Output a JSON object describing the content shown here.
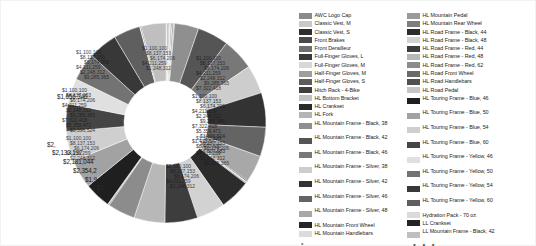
{
  "chart_data": {
    "type": "pie",
    "variant": "donut",
    "title": "",
    "subtitle": "",
    "xlabel": "",
    "ylabel": "",
    "grid": false,
    "legend_position": "right",
    "legend_columns": 2,
    "legend_truncated": true,
    "legend_truncation_glyph": "• • •",
    "value_prefix": "$",
    "value_format": "currency-thousands-separator",
    "donut_hole_ratio": 0.42,
    "palette_type": "grayscale",
    "visible_value_labels": [
      "$1,656,346",
      "$2,133,197",
      "$2,181,044",
      "$2,354,2",
      "$1,9",
      "$2,",
      "$1,"
    ],
    "categories": [
      "AWC Logo Cap",
      "Classic Vest, M",
      "Classic Vest, S",
      "Front Brakes",
      "Front Derailleur",
      "Full-Finger Gloves, L",
      "Full-Finger Gloves, M",
      "Half-Finger Gloves, M",
      "Half-Finger Gloves, S",
      "Hitch Rack - 4-Bike",
      "HL Bottom Bracket",
      "HL Crankset",
      "HL Fork",
      "HL Mountain Frame - Black, 38",
      "HL Mountain Frame - Black, 42",
      "HL Mountain Frame - Black, 46",
      "HL Mountain Frame - Silver, 38",
      "HL Mountain Frame - Silver, 42",
      "HL Mountain Frame - Silver, 46",
      "HL Mountain Frame - Silver, 48",
      "HL Mountain Front Wheel",
      "HL Mountain Handlebars",
      "HL Mountain Pedal",
      "HL Mountain Rear Wheel",
      "HL Road Frame - Black, 44",
      "HL Road Frame - Black, 48",
      "HL Road Frame - Red, 44",
      "HL Road Frame - Red, 48",
      "HL Road Frame - Red, 62",
      "HL Road Front Wheel",
      "HL Road Handlebars",
      "HL Road Pedal",
      "HL Touring Frame - Blue, 46",
      "HL Touring Frame - Blue, 50",
      "HL Touring Frame - Blue, 54",
      "HL Touring Frame - Blue, 60",
      "HL Touring Frame - Yellow, 46",
      "HL Touring Frame - Yellow, 50",
      "HL Touring Frame - Yellow, 54",
      "HL Touring Frame - Yellow, 60",
      "Hydration Pack - 70 oz.",
      "LL Crankset",
      "LL Mountain Frame - Black, 42"
    ],
    "values": [
      51229,
      38573,
      26928,
      64432,
      44213,
      34756,
      29881,
      31204,
      25117,
      57622,
      43109,
      61840,
      72355,
      1656346,
      2133197,
      2181044,
      1954223,
      2354233,
      2006118,
      1872540,
      66124,
      39871,
      28306,
      70452,
      2088912,
      1945330,
      2241507,
      2113994,
      1877260,
      59118,
      41260,
      27433,
      1799640,
      1962318,
      2044875,
      1881092,
      1748210,
      1903466,
      1988031,
      1822774,
      48902,
      55317,
      1693418
    ]
  },
  "legend": {
    "column_1": [
      {
        "label": "AWC Logo Cap",
        "color": "#8a8a8a"
      },
      {
        "label": "Classic Vest, M",
        "color": "#c9c9c9"
      },
      {
        "label": "Classic Vest, S",
        "color": "#2e2e2e"
      },
      {
        "label": "Front Brakes",
        "color": "#4a4a4a"
      },
      {
        "label": "Front Derailleur",
        "color": "#6f6f6f"
      },
      {
        "label": "Full-Finger Gloves, L",
        "color": "#3a3a3a"
      },
      {
        "label": "Full-Finger Gloves, M",
        "color": "#d8d8d8"
      },
      {
        "label": "Half-Finger Gloves, M",
        "color": "#9e9e9e"
      },
      {
        "label": "Half-Finger Gloves, S",
        "color": "#5c5c5c"
      },
      {
        "label": "Hitch Rack - 4-Bike",
        "color": "#3f3f3f"
      },
      {
        "label": "HL Bottom Bracket",
        "color": "#c2c2c2"
      },
      {
        "label": "HL Crankset",
        "color": "#2a2a2a"
      },
      {
        "label": "HL Fork",
        "color": "#b4b4b4"
      },
      {
        "label": "HL Mountain Frame - Black, 38",
        "color": "#8f8f8f"
      },
      {
        "label": "HL Mountain Frame - Black, 42",
        "color": "#555555"
      },
      {
        "label": "HL Mountain Frame - Black, 46",
        "color": "#787878"
      },
      {
        "label": "HL Mountain Frame - Silver, 38",
        "color": "#cdcdcd"
      },
      {
        "label": "HL Mountain Frame - Silver, 42",
        "color": "#333333"
      },
      {
        "label": "HL Mountain Frame - Silver, 46",
        "color": "#646464"
      },
      {
        "label": "HL Mountain Frame - Silver, 48",
        "color": "#a8a8a8"
      },
      {
        "label": "HL Mountain Front Wheel",
        "color": "#262626"
      },
      {
        "label": "HL Mountain Handlebars",
        "color": "#dcdcdc"
      }
    ],
    "column_2": [
      {
        "label": "HL Mountain Pedal",
        "color": "#9a9a9a"
      },
      {
        "label": "HL Mountain Rear Wheel",
        "color": "#7e7e7e"
      },
      {
        "label": "HL Road Frame - Black, 44",
        "color": "#2c2c2c"
      },
      {
        "label": "HL Road Frame - Black, 48",
        "color": "#d2d2d2"
      },
      {
        "label": "HL Road Frame - Red, 44",
        "color": "#3d3d3d"
      },
      {
        "label": "HL Road Frame - Red, 48",
        "color": "#b8b8b8"
      },
      {
        "label": "HL Road Frame - Red, 62",
        "color": "#8c8c8c"
      },
      {
        "label": "HL Road Front Wheel",
        "color": "#6a6a6a"
      },
      {
        "label": "HL Road Handlebars",
        "color": "#505050"
      },
      {
        "label": "HL Road Pedal",
        "color": "#c6c6c6"
      },
      {
        "label": "HL Touring Frame - Blue, 46",
        "color": "#1f1f1f"
      },
      {
        "label": "HL Touring Frame - Blue, 50",
        "color": "#a2a2a2"
      },
      {
        "label": "HL Touring Frame - Blue, 54",
        "color": "#cfcfcf"
      },
      {
        "label": "HL Touring Frame - Blue, 60",
        "color": "#454545"
      },
      {
        "label": "HL Touring Frame - Yellow, 46",
        "color": "#e0e0e0"
      },
      {
        "label": "HL Touring Frame - Yellow, 50",
        "color": "#737373"
      },
      {
        "label": "HL Touring Frame - Yellow, 54",
        "color": "#383838"
      },
      {
        "label": "HL Touring Frame - Yellow, 60",
        "color": "#5f5f5f"
      },
      {
        "label": "Hydration Pack - 70 oz.",
        "color": "#dadada"
      },
      {
        "label": "LL Crankset",
        "color": "#242424"
      },
      {
        "label": "LL Mountain Frame - Black, 42",
        "color": "#bfbfbf"
      }
    ]
  }
}
